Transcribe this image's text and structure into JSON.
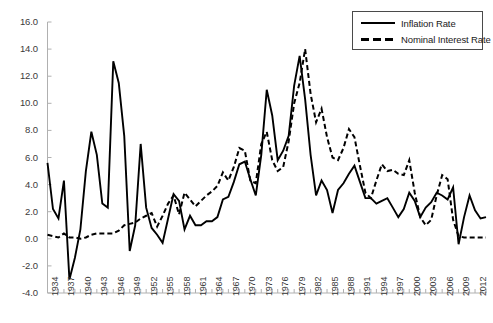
{
  "chart_data": {
    "type": "line",
    "title": "",
    "xlabel": "",
    "ylabel": "",
    "grid": false,
    "legend_position": "top-right",
    "xlim": [
      1934,
      2014
    ],
    "ylim": [
      -4.0,
      16.0
    ],
    "ytick_labels": [
      "16.0",
      "14.0",
      "12.0",
      "10.0",
      "8.0",
      "6.0",
      "4.0",
      "2.0",
      "0.0",
      "-2.0",
      "-4.0"
    ],
    "ytick_values": [
      16.0,
      14.0,
      12.0,
      10.0,
      8.0,
      6.0,
      4.0,
      2.0,
      0.0,
      -2.0,
      -4.0
    ],
    "xtick_labels": [
      "1934",
      "1937",
      "1940",
      "1943",
      "1946",
      "1949",
      "1952",
      "1955",
      "1958",
      "1961",
      "1964",
      "1967",
      "1970",
      "1973",
      "1976",
      "1979",
      "1982",
      "1985",
      "1988",
      "1991",
      "1994",
      "1997",
      "2000",
      "2003",
      "2006",
      "2009",
      "2012"
    ],
    "xtick_values": [
      1934,
      1937,
      1940,
      1943,
      1946,
      1949,
      1952,
      1955,
      1958,
      1961,
      1964,
      1967,
      1970,
      1973,
      1976,
      1979,
      1982,
      1985,
      1988,
      1991,
      1994,
      1997,
      2000,
      2003,
      2006,
      2009,
      2012
    ],
    "x": [
      1934,
      1935,
      1936,
      1937,
      1938,
      1939,
      1940,
      1941,
      1942,
      1943,
      1944,
      1945,
      1946,
      1947,
      1948,
      1949,
      1950,
      1951,
      1952,
      1953,
      1954,
      1955,
      1956,
      1957,
      1958,
      1959,
      1960,
      1961,
      1962,
      1963,
      1964,
      1965,
      1966,
      1967,
      1968,
      1969,
      1970,
      1971,
      1972,
      1973,
      1974,
      1975,
      1976,
      1977,
      1978,
      1979,
      1980,
      1981,
      1982,
      1983,
      1984,
      1985,
      1986,
      1987,
      1988,
      1989,
      1990,
      1991,
      1992,
      1993,
      1994,
      1995,
      1996,
      1997,
      1998,
      1999,
      2000,
      2001,
      2002,
      2003,
      2004,
      2005,
      2006,
      2007,
      2008,
      2009,
      2010,
      2011,
      2012,
      2013,
      2014
    ],
    "series": [
      {
        "name": "Inflation Rate",
        "style": "solid",
        "color": "#000000",
        "values": [
          5.6,
          2.2,
          1.5,
          4.3,
          -3.0,
          -1.4,
          0.7,
          5.0,
          7.9,
          6.2,
          2.6,
          2.3,
          13.1,
          11.5,
          7.6,
          -0.9,
          1.0,
          7.0,
          2.3,
          0.8,
          0.3,
          -0.3,
          1.5,
          3.3,
          2.8,
          0.7,
          1.7,
          1.0,
          1.0,
          1.3,
          1.3,
          1.6,
          2.9,
          3.1,
          4.2,
          5.5,
          5.7,
          4.4,
          3.2,
          6.2,
          11.0,
          9.1,
          5.8,
          6.5,
          7.6,
          11.3,
          13.5,
          10.3,
          6.2,
          3.2,
          4.3,
          3.6,
          1.9,
          3.6,
          4.1,
          4.8,
          5.4,
          4.2,
          3.0,
          3.0,
          2.6,
          2.8,
          3.0,
          2.3,
          1.6,
          2.2,
          3.4,
          2.8,
          1.6,
          2.3,
          2.7,
          3.4,
          3.2,
          2.9,
          3.8,
          -0.4,
          1.6,
          3.2,
          2.1,
          1.5,
          1.6
        ]
      },
      {
        "name": "Nominal Interest Rate",
        "style": "dashed",
        "color": "#000000",
        "values": [
          0.3,
          0.2,
          0.1,
          0.4,
          0.1,
          0.1,
          0.0,
          0.1,
          0.3,
          0.4,
          0.4,
          0.4,
          0.4,
          0.6,
          1.0,
          1.1,
          1.2,
          1.5,
          1.7,
          1.9,
          0.9,
          1.7,
          2.6,
          3.2,
          1.8,
          3.4,
          2.9,
          2.4,
          2.8,
          3.2,
          3.5,
          3.9,
          4.9,
          4.3,
          5.3,
          6.7,
          6.5,
          4.3,
          4.1,
          7.0,
          7.9,
          5.8,
          5.0,
          5.3,
          7.2,
          10.0,
          11.5,
          14.0,
          10.7,
          8.6,
          9.6,
          7.5,
          6.0,
          5.8,
          6.7,
          8.1,
          7.5,
          5.4,
          3.4,
          3.0,
          4.3,
          5.5,
          5.0,
          5.1,
          4.8,
          4.7,
          5.8,
          3.4,
          1.6,
          1.0,
          1.4,
          3.2,
          4.7,
          4.4,
          1.4,
          0.2,
          0.1,
          0.1,
          0.1,
          0.1,
          0.1
        ]
      }
    ]
  },
  "legend": {
    "entries": [
      {
        "label": "Inflation Rate",
        "style": "solid"
      },
      {
        "label": "Nominal Interest Rate",
        "style": "dashed"
      }
    ]
  },
  "axes": {
    "y_axis_color": "#b0b0b0",
    "x_axis_color": "#b0b0b0",
    "tick_color": "#b0b0b0"
  }
}
